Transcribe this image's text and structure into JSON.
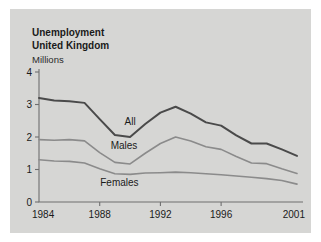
{
  "figure": {
    "background_color": "#d6d6d4",
    "page_background_color": "#ffffff",
    "title_line1": "Unemployment",
    "title_line2": "United Kingdom",
    "unit_label": "Millions"
  },
  "chart_data": {
    "type": "line",
    "title": "Unemployment United Kingdom",
    "subtitle": "Millions",
    "xlabel": "",
    "ylabel": "Millions",
    "xlim": [
      1984,
      2001
    ],
    "ylim": [
      0,
      4
    ],
    "ytick_labels": [
      "0",
      "1",
      "2",
      "3",
      "4"
    ],
    "yticks": [
      0,
      1,
      2,
      3,
      4
    ],
    "xtick_labels": [
      "1984",
      "1988",
      "1992",
      "1996",
      "2001"
    ],
    "xticks": [
      1984,
      1988,
      1992,
      1996,
      2001
    ],
    "grid": false,
    "legend_position": "inline-annotations",
    "x": [
      1984,
      1985,
      1986,
      1987,
      1988,
      1989,
      1990,
      1991,
      1992,
      1993,
      1994,
      1995,
      1996,
      1997,
      1998,
      1999,
      2000,
      2001
    ],
    "series": [
      {
        "name": "All",
        "color": "#4a4a4a",
        "width": 2.0,
        "label_x": 1990.0,
        "label_y": 2.38,
        "values": [
          3.2,
          3.12,
          3.1,
          3.05,
          2.55,
          2.06,
          2.0,
          2.4,
          2.75,
          2.93,
          2.72,
          2.45,
          2.35,
          2.05,
          1.8,
          1.8,
          1.62,
          1.42
        ]
      },
      {
        "name": "Males",
        "color": "#8b8b8b",
        "width": 1.6,
        "label_x": 1989.6,
        "label_y": 1.62,
        "values": [
          1.92,
          1.9,
          1.92,
          1.88,
          1.52,
          1.22,
          1.17,
          1.5,
          1.8,
          2.0,
          1.88,
          1.7,
          1.62,
          1.4,
          1.2,
          1.18,
          1.02,
          0.88
        ]
      },
      {
        "name": "Females",
        "color": "#8b8b8b",
        "width": 1.6,
        "label_x": 1989.3,
        "label_y": 0.5,
        "values": [
          1.3,
          1.26,
          1.25,
          1.2,
          1.02,
          0.87,
          0.85,
          0.89,
          0.9,
          0.92,
          0.9,
          0.87,
          0.84,
          0.8,
          0.76,
          0.72,
          0.66,
          0.55
        ]
      }
    ]
  }
}
